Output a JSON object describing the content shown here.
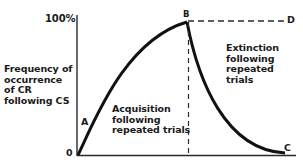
{
  "diagram": {
    "y_axis": {
      "top_tick": "100%",
      "bottom_tick": "0",
      "label_lines": [
        "Frequency of",
        "occurrence",
        "of CR",
        "following CS"
      ]
    },
    "points": {
      "A": "A",
      "B": "B",
      "C": "C",
      "D": "D"
    },
    "acquisition_label": [
      "Acquisition",
      "following",
      "repeated trials"
    ],
    "extinction_label": [
      "Extinction",
      "following",
      "repeated",
      "trials"
    ],
    "colors": {
      "line": "#111111",
      "axis": "#2a2a2a",
      "text": "#1a1a1a",
      "background": "#ffffff"
    }
  }
}
